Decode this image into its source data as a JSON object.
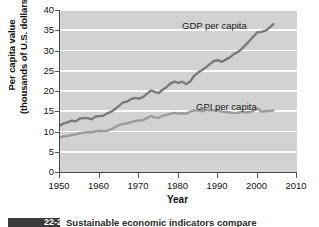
{
  "figure": {
    "background_color": "#ffffff",
    "plot_background_color": "#d2d2d2",
    "gridline_color": "#fbfbfb",
    "axis_color": "#4a4a4a"
  },
  "annotations": {
    "gdp_label": "GDP per capita",
    "gpi_label": "GPI per capita"
  },
  "caption": {
    "number": "22-2",
    "text": "Sustainable economic indicators compare"
  },
  "chart_data": {
    "type": "line",
    "title": "",
    "xlabel": "Year",
    "ylabel": "Per capita value (thousands of U.S. dollars)",
    "ylabel_line1": "Per capita value",
    "ylabel_line2": "(thousands of U.S. dollars)",
    "xlim": [
      1950,
      2010
    ],
    "ylim": [
      0,
      40
    ],
    "xticks": [
      1950,
      1960,
      1970,
      1980,
      1990,
      2000,
      2010
    ],
    "yticks": [
      0,
      5,
      10,
      15,
      20,
      25,
      30,
      35,
      40
    ],
    "grid": "horizontal",
    "legend_position": "inline-annotation",
    "series": [
      {
        "name": "GDP per capita",
        "color": "#7a7a7a",
        "x": [
          1950,
          1951,
          1952,
          1953,
          1954,
          1955,
          1956,
          1957,
          1958,
          1959,
          1960,
          1961,
          1962,
          1963,
          1964,
          1965,
          1966,
          1967,
          1968,
          1969,
          1970,
          1971,
          1972,
          1973,
          1974,
          1975,
          1976,
          1977,
          1978,
          1979,
          1980,
          1981,
          1982,
          1983,
          1984,
          1985,
          1986,
          1987,
          1988,
          1989,
          1990,
          1991,
          1992,
          1993,
          1994,
          1995,
          1996,
          1997,
          1998,
          1999,
          2000,
          2001,
          2002,
          2003,
          2004
        ],
        "values": [
          11.5,
          12.0,
          12.3,
          12.7,
          12.5,
          13.2,
          13.3,
          13.3,
          13.0,
          13.7,
          13.8,
          13.9,
          14.5,
          14.9,
          15.6,
          16.4,
          17.2,
          17.4,
          18.0,
          18.3,
          18.1,
          18.5,
          19.3,
          20.1,
          19.8,
          19.5,
          20.3,
          21.0,
          21.9,
          22.3,
          22.0,
          22.3,
          21.7,
          22.4,
          23.8,
          24.6,
          25.2,
          25.9,
          26.7,
          27.4,
          27.6,
          27.2,
          27.8,
          28.3,
          29.1,
          29.6,
          30.4,
          31.4,
          32.4,
          33.5,
          34.5,
          34.6,
          34.9,
          35.6,
          36.5
        ]
      },
      {
        "name": "GPI per capita",
        "color": "#9a9a9a",
        "x": [
          1950,
          1951,
          1952,
          1953,
          1954,
          1955,
          1956,
          1957,
          1958,
          1959,
          1960,
          1961,
          1962,
          1963,
          1964,
          1965,
          1966,
          1967,
          1968,
          1969,
          1970,
          1971,
          1972,
          1973,
          1974,
          1975,
          1976,
          1977,
          1978,
          1979,
          1980,
          1981,
          1982,
          1983,
          1984,
          1985,
          1986,
          1987,
          1988,
          1989,
          1990,
          1991,
          1992,
          1993,
          1994,
          1995,
          1996,
          1997,
          1998,
          1999,
          2000,
          2001,
          2002,
          2003,
          2004
        ],
        "values": [
          8.5,
          8.8,
          8.9,
          9.2,
          9.3,
          9.6,
          9.7,
          9.8,
          9.8,
          10.1,
          10.2,
          10.1,
          10.2,
          10.6,
          11.1,
          11.6,
          11.9,
          12.0,
          12.3,
          12.6,
          12.7,
          12.8,
          13.3,
          13.8,
          13.5,
          13.4,
          13.9,
          14.1,
          14.4,
          14.6,
          14.4,
          14.5,
          14.4,
          14.9,
          15.2,
          15.2,
          15.0,
          15.3,
          15.2,
          15.2,
          15.3,
          14.9,
          14.8,
          14.7,
          14.6,
          14.6,
          14.9,
          14.7,
          14.8,
          15.1,
          15.7,
          14.9,
          15.0,
          15.1,
          15.2
        ]
      }
    ]
  }
}
